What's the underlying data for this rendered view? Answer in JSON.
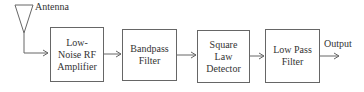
{
  "diagram": {
    "type": "block-diagram",
    "title": "",
    "antenna": {
      "label": "Antenna"
    },
    "blocks": [
      {
        "id": "lna",
        "lines": [
          "Low-",
          "Noise RF",
          "Amplifier"
        ]
      },
      {
        "id": "bpf",
        "lines": [
          "Bandpass",
          "Filter"
        ]
      },
      {
        "id": "sld",
        "lines": [
          "Square",
          "Law",
          "Detector"
        ]
      },
      {
        "id": "lpf",
        "lines": [
          "Low Pass",
          "Filter"
        ]
      }
    ],
    "output": {
      "label": "Output"
    },
    "connections": [
      [
        "antenna",
        "lna"
      ],
      [
        "lna",
        "bpf"
      ],
      [
        "bpf",
        "sld"
      ],
      [
        "sld",
        "lpf"
      ],
      [
        "lpf",
        "output"
      ]
    ],
    "colors": {
      "line": "#666666",
      "text": "#333333",
      "background": "#ffffff"
    }
  }
}
